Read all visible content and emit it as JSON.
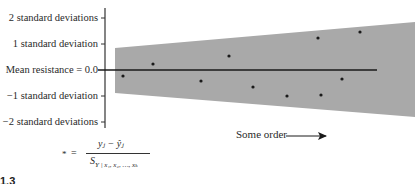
{
  "diagram": {
    "y_axis": {
      "ticks": [
        {
          "label": "2 standard deviations",
          "value": 2
        },
        {
          "label": "1 standard deviation",
          "value": 1
        },
        {
          "label": "Mean resistance = 0.0",
          "value": 0
        },
        {
          "label": "−1 standard deviation",
          "value": -1
        },
        {
          "label": "−2 standard deviations",
          "value": -2
        }
      ]
    },
    "x_axis": {
      "label": "Some order",
      "arrow": "right-arrow"
    },
    "band": {
      "color": "#a9a9a9",
      "left": {
        "upper": 0.85,
        "lower": -0.9
      },
      "right": {
        "upper": 1.85,
        "lower": -1.8
      }
    },
    "marker_symbol": "*",
    "points": [
      {
        "order": 1,
        "value": -0.23
      },
      {
        "order": 2,
        "value": 0.23
      },
      {
        "order": 3,
        "value": -0.42
      },
      {
        "order": 4,
        "value": 0.54
      },
      {
        "order": 5,
        "value": -0.65
      },
      {
        "order": 6,
        "value": -1.0
      },
      {
        "order": 7,
        "value": 1.23
      },
      {
        "order": 8,
        "value": -0.96
      },
      {
        "order": 9,
        "value": -0.35
      },
      {
        "order": 10,
        "value": 1.46
      }
    ],
    "formula": {
      "lhs": "*",
      "equals": "=",
      "numerator": "yⱼ − ŷⱼ",
      "denominator_main": "S",
      "denominator_sub": "Y | x₁, x₂, …, xₖ"
    },
    "figure_label": "1.3"
  }
}
